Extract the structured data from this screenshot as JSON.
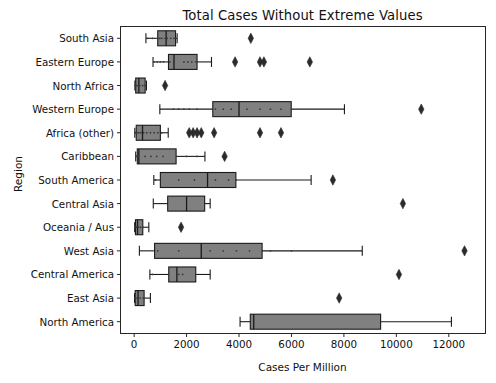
{
  "chart_data": {
    "type": "box",
    "title": "Total Cases Without Extreme Values",
    "xlabel": "Cases Per Million",
    "ylabel": "Region",
    "xlim": [
      -520,
      13400
    ],
    "xticks": [
      0,
      2000,
      4000,
      6000,
      8000,
      10000,
      12000
    ],
    "xticklabels": [
      "0",
      "2000",
      "4000",
      "6000",
      "8000",
      "10000",
      "12000"
    ],
    "grid": false,
    "legend": null,
    "orientation": "horizontal",
    "box_facecolor": "#808080",
    "box_edgecolor": "#1a1a1a",
    "categories": [
      "South Asia",
      "Eastern Europe",
      "North Africa",
      "Western Europe",
      "Africa (other)",
      "Caribbean",
      "South America",
      "Central Asia",
      "Oceania / Aus",
      "West Asia",
      "Central America",
      "East Asia",
      "North America"
    ],
    "boxes": [
      {
        "category": "South Asia",
        "whisker_low": 450,
        "q1": 900,
        "median": 1220,
        "q3": 1580,
        "whisker_high": 1640,
        "outliers": [
          4450
        ],
        "points": [
          520,
          700,
          900,
          980,
          1060,
          1180,
          1260,
          1400,
          1520,
          1580
        ]
      },
      {
        "category": "Eastern Europe",
        "whisker_low": 720,
        "q1": 1310,
        "median": 1520,
        "q3": 2400,
        "whisker_high": 2950,
        "outliers": [
          3850,
          4800,
          4950,
          6700
        ],
        "points": [
          760,
          880,
          1000,
          1120,
          1360,
          1520,
          1900,
          2050,
          2200,
          2350
        ]
      },
      {
        "category": "North Africa",
        "whisker_low": 30,
        "q1": 60,
        "median": 180,
        "q3": 420,
        "whisker_high": 470,
        "outliers": [
          1180
        ],
        "points": [
          40,
          90,
          150,
          220,
          330,
          420
        ]
      },
      {
        "category": "Western Europe",
        "whisker_low": 980,
        "q1": 3000,
        "median": 4000,
        "q3": 5990,
        "whisker_high": 8020,
        "outliers": [
          10950
        ],
        "points": [
          1500,
          1700,
          1900,
          2100,
          2400,
          3100,
          3400,
          3700,
          4000,
          4300,
          4800,
          5200,
          5600
        ]
      },
      {
        "category": "Africa (other)",
        "whisker_low": 25,
        "q1": 80,
        "median": 320,
        "q3": 1000,
        "whisker_high": 1300,
        "outliers": [
          2100,
          2250,
          2400,
          2560,
          3050,
          4800,
          5600
        ],
        "points": [
          40,
          70,
          110,
          180,
          260,
          360,
          480,
          620,
          760,
          900,
          1050
        ]
      },
      {
        "category": "Caribbean",
        "whisker_low": 60,
        "q1": 120,
        "median": 180,
        "q3": 1600,
        "whisker_high": 2700,
        "outliers": [
          3450
        ],
        "points": [
          90,
          150,
          420,
          640,
          860,
          1100,
          2000,
          2400
        ]
      },
      {
        "category": "South America",
        "whisker_low": 750,
        "q1": 1000,
        "median": 2800,
        "q3": 3880,
        "whisker_high": 6750,
        "outliers": [
          7580
        ],
        "points": [
          820,
          1700,
          2300,
          3100,
          3600,
          3880
        ]
      },
      {
        "category": "Central Asia",
        "whisker_low": 730,
        "q1": 1280,
        "median": 2000,
        "q3": 2690,
        "whisker_high": 2900,
        "outliers": [
          10250
        ]
      },
      {
        "category": "Oceania / Aus",
        "whisker_low": 20,
        "q1": 50,
        "median": 130,
        "q3": 330,
        "whisker_high": 560,
        "outliers": [
          1790
        ],
        "points": [
          30,
          80,
          160,
          240,
          320
        ]
      },
      {
        "category": "West Asia",
        "whisker_low": 200,
        "q1": 780,
        "median": 2560,
        "q3": 4880,
        "whisker_high": 8700,
        "outliers": [
          12600
        ],
        "points": [
          900,
          1700,
          2900,
          3400,
          3900,
          4400,
          5200,
          6000
        ]
      },
      {
        "category": "Central America",
        "whisker_low": 600,
        "q1": 1320,
        "median": 1630,
        "q3": 2350,
        "whisker_high": 2900,
        "outliers": [
          10100
        ],
        "points": [
          700,
          1700,
          1850
        ]
      },
      {
        "category": "East Asia",
        "whisker_low": 15,
        "q1": 40,
        "median": 150,
        "q3": 380,
        "whisker_high": 620,
        "outliers": [
          7820
        ],
        "points": [
          25,
          60,
          120,
          230,
          340
        ]
      },
      {
        "category": "North America",
        "whisker_low": 4040,
        "q1": 4430,
        "median": 4560,
        "q3": 9400,
        "whisker_high": 12100,
        "points": []
      }
    ]
  }
}
